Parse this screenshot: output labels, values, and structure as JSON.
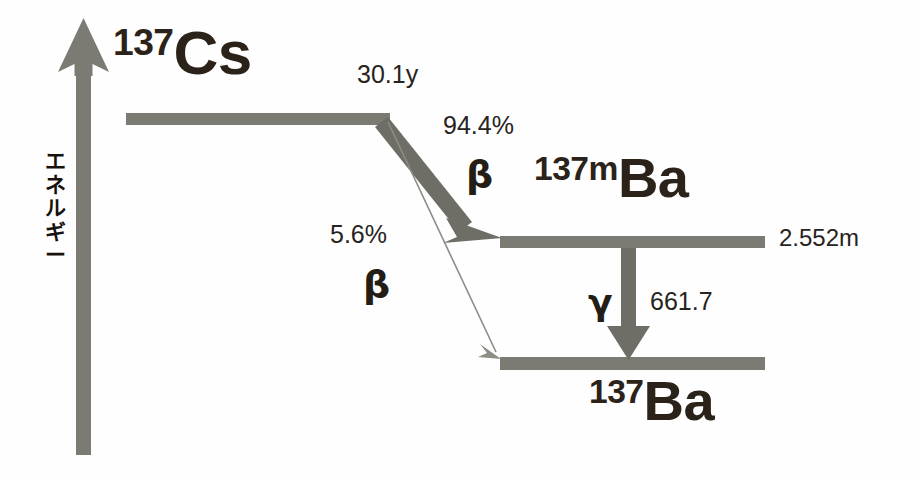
{
  "diagram": {
    "axis": {
      "name": "energy-axis",
      "label_chars": [
        "エ",
        "ネ",
        "ル",
        "ギ",
        "ー"
      ],
      "label_text": "エネルギー",
      "direction": "up"
    },
    "colors": {
      "level_bar": "#7b7b74",
      "arrow": "#6e6e67",
      "thin_line": "#8d8d86",
      "text_dark": "#2b2219",
      "text_annot": "#272320",
      "background": "#fefefe"
    },
    "levels": [
      {
        "id": "cs137",
        "mass": "137",
        "symbol": "Cs",
        "halflife": "30.1y"
      },
      {
        "id": "ba137m",
        "mass": "137m",
        "symbol": "Ba",
        "halflife": "2.552m"
      },
      {
        "id": "ba137",
        "mass": "137",
        "symbol": "Ba",
        "halflife": ""
      }
    ],
    "transitions": [
      {
        "id": "beta-major",
        "intensity": "94.4%",
        "particle": "β",
        "from": "cs137",
        "to": "ba137m",
        "style": "thick-arrow"
      },
      {
        "id": "beta-minor",
        "intensity": "5.6%",
        "particle": "β",
        "from": "cs137",
        "to": "ba137",
        "style": "thin-arrow"
      },
      {
        "id": "gamma",
        "energy": "661.7",
        "particle": "γ",
        "from": "ba137m",
        "to": "ba137",
        "style": "thick-arrow-vertical"
      }
    ]
  }
}
